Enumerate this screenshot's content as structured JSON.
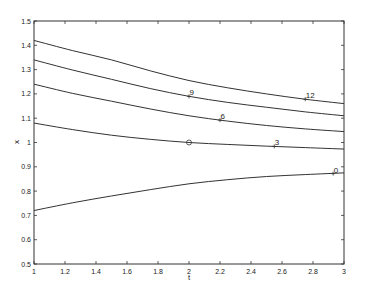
{
  "chart_data": {
    "type": "line",
    "title": "",
    "xlabel": "t",
    "ylabel": "x",
    "xlim": [
      1,
      3
    ],
    "ylim": [
      0.5,
      1.5
    ],
    "grid": false,
    "legend": null,
    "x_ticks": [
      1,
      1.2,
      1.4,
      1.6,
      1.8,
      2,
      2.2,
      2.4,
      2.6,
      2.8,
      3
    ],
    "x_tick_labels": [
      "1",
      "1.2",
      "1.4",
      "1.6",
      "1.8",
      "2",
      "2.2",
      "2.4",
      "2.6",
      "2.8",
      "3"
    ],
    "y_ticks": [
      0.5,
      0.6,
      0.7,
      0.8,
      0.9,
      1,
      1.1,
      1.2,
      1.3,
      1.4,
      1.5
    ],
    "y_tick_labels": [
      "0.5",
      "0.6",
      "0.7",
      "0.8",
      "0.9",
      "1",
      "1.1",
      "1.2",
      "1.3",
      "1.4",
      "1.5"
    ],
    "x": [
      1,
      1.25,
      1.5,
      1.75,
      2,
      2.25,
      2.5,
      2.75,
      3
    ],
    "series": [
      {
        "name": "12",
        "values": [
          1.42,
          1.378,
          1.34,
          1.295,
          1.255,
          1.225,
          1.2,
          1.178,
          1.16
        ],
        "label_at": [
          2.75,
          1.178
        ]
      },
      {
        "name": "9",
        "values": [
          1.34,
          1.298,
          1.26,
          1.222,
          1.19,
          1.165,
          1.145,
          1.126,
          1.11
        ],
        "label_at": [
          2.0,
          1.19
        ]
      },
      {
        "name": "6",
        "values": [
          1.24,
          1.202,
          1.17,
          1.138,
          1.11,
          1.088,
          1.07,
          1.056,
          1.045
        ],
        "label_at": [
          2.2,
          1.092
        ]
      },
      {
        "name": "3",
        "values": [
          1.08,
          1.053,
          1.03,
          1.013,
          1.0,
          0.992,
          0.985,
          0.979,
          0.973
        ],
        "label_at": [
          2.55,
          0.984
        ]
      },
      {
        "name": "0",
        "values": [
          0.72,
          0.752,
          0.78,
          0.806,
          0.83,
          0.847,
          0.86,
          0.868,
          0.875
        ],
        "label_at": [
          2.93,
          0.872
        ]
      }
    ],
    "annotations": [
      {
        "type": "circle-marker",
        "x": 2,
        "y": 1.0
      }
    ]
  }
}
